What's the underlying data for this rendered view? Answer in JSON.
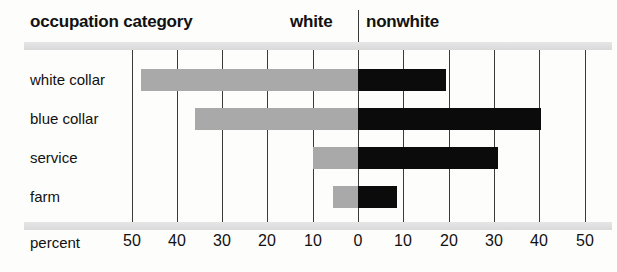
{
  "header": {
    "occupation_label": "occupation category",
    "left_group_label": "white",
    "right_group_label": "nonwhite"
  },
  "axis": {
    "caption": "percent",
    "tick_labels": [
      "50",
      "40",
      "30",
      "20",
      "10",
      "0",
      "10",
      "20",
      "30",
      "40",
      "50"
    ]
  },
  "colors": {
    "left_bar": "#a9a9a9",
    "right_bar": "#0b0b0b",
    "rail": "#e0e0e0",
    "gridline": "#3a3a3a"
  },
  "rows": [
    {
      "label": "white collar"
    },
    {
      "label": "blue collar"
    },
    {
      "label": "service"
    },
    {
      "label": "farm"
    }
  ],
  "chart_data": {
    "type": "bar",
    "title": "occupation category",
    "subtitle": "",
    "orientation": "horizontal",
    "layout": "diverging-bidirectional-bar",
    "categories": [
      "white collar",
      "blue collar",
      "service",
      "farm"
    ],
    "series": [
      {
        "name": "white",
        "side": "left",
        "color": "#a9a9a9",
        "values": [
          48,
          36,
          10,
          5.5
        ]
      },
      {
        "name": "nonwhite",
        "side": "right",
        "color": "#0b0b0b",
        "values": [
          19.5,
          40.5,
          31,
          8.5
        ]
      }
    ],
    "xlabel": "percent",
    "ylabel": "occupation category",
    "xlim": [
      -50,
      50
    ],
    "xticks": [
      -50,
      -40,
      -30,
      -20,
      -10,
      0,
      10,
      20,
      30,
      40,
      50
    ],
    "xtick_labels": [
      "50",
      "40",
      "30",
      "20",
      "10",
      "0",
      "10",
      "20",
      "30",
      "40",
      "50"
    ],
    "grid": true,
    "grid_axis": "x",
    "legend": "inline-header",
    "units": "percent"
  }
}
